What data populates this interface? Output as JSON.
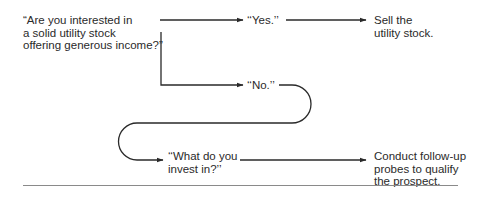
{
  "diagram": {
    "type": "sales-dialogue-flowchart",
    "nodes": {
      "question": {
        "lines": [
          "“Are you interested in",
          "a solid utility stock",
          "offering generous income?”"
        ]
      },
      "yes": {
        "lines": [
          "‘‘Yes.’’"
        ]
      },
      "sell": {
        "lines": [
          "Sell the",
          "utility stock."
        ]
      },
      "no": {
        "lines": [
          "‘‘No.’’"
        ]
      },
      "what": {
        "lines": [
          "‘‘What do you",
          "invest in?’’"
        ]
      },
      "conduct": {
        "lines": [
          "Conduct follow-up",
          "probes to qualify",
          "the prospect."
        ]
      }
    },
    "edges": [
      {
        "from": "question",
        "to": "yes"
      },
      {
        "from": "yes",
        "to": "sell"
      },
      {
        "from": "question",
        "to": "no"
      },
      {
        "from": "no",
        "to": "what"
      },
      {
        "from": "what",
        "to": "conduct"
      }
    ],
    "colors": {
      "ink": "#2a2a2a",
      "rule": "#8a8a8a",
      "background": "#ffffff"
    }
  }
}
